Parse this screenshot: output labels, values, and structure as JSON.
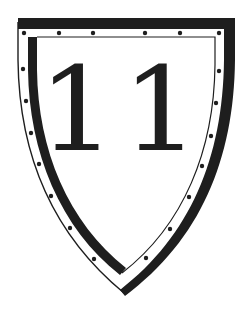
{
  "emblem": {
    "type": "heraldic-shield",
    "number": "11",
    "colors": {
      "ink": "#1e1e1e",
      "background": "#ffffff"
    },
    "rivets": {
      "top": [
        [
          24,
          33
        ],
        [
          59,
          33
        ],
        [
          93,
          33
        ],
        [
          145,
          33
        ],
        [
          180,
          33
        ],
        [
          219,
          33
        ]
      ],
      "left": [
        [
          23,
          69
        ],
        [
          26,
          101
        ],
        [
          31,
          133
        ],
        [
          39,
          164
        ],
        [
          51,
          196
        ],
        [
          70,
          228
        ],
        [
          94,
          259
        ]
      ],
      "right": [
        [
          219,
          71
        ],
        [
          216,
          103
        ],
        [
          211,
          136
        ],
        [
          202,
          166
        ],
        [
          189,
          197
        ],
        [
          170,
          229
        ],
        [
          146,
          258
        ]
      ]
    }
  }
}
